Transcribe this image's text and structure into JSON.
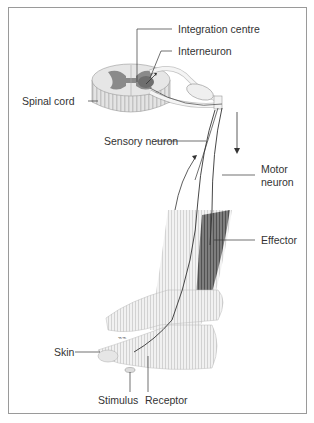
{
  "figure": {
    "type": "reflex-arc-diagram",
    "labels": {
      "integration_centre": "Integration centre",
      "interneuron": "Interneuron",
      "spinal_cord": "Spinal cord",
      "sensory_neuron": "Sensory neuron",
      "motor_neuron_line1": "Motor",
      "motor_neuron_line2": "neuron",
      "effector": "Effector",
      "skin": "Skin",
      "stimulus": "Stimulus",
      "receptor": "Receptor"
    },
    "colors": {
      "frame": "#9a9a9a",
      "text": "#333333",
      "grey_matter": "#8a8a8a",
      "white_matter": "#dcdcdc",
      "muscle": "#4a4a4a",
      "neuron_line": "#444444"
    }
  }
}
